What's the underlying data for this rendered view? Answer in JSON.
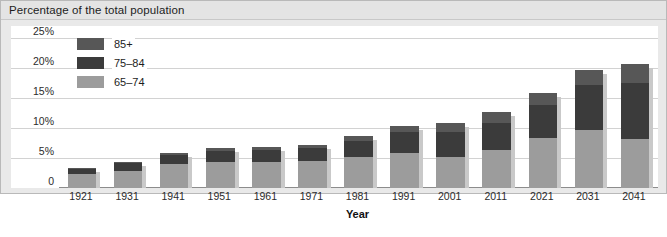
{
  "panel": {
    "title": "Percentage of the total population"
  },
  "axis": {
    "x_title": "Year",
    "y_tick_labels": [
      "0",
      "5%",
      "10%",
      "15%",
      "20%",
      "25%"
    ]
  },
  "legend": {
    "entries": [
      {
        "label": "85+",
        "color": "#575757"
      },
      {
        "label": "75–84",
        "color": "#3b3b3b"
      },
      {
        "label": "65–74",
        "color": "#9c9c9c"
      }
    ]
  },
  "chart_data": {
    "type": "bar",
    "stacked": true,
    "title": "Percentage of the total population",
    "xlabel": "Year",
    "ylabel": "",
    "ylim": [
      0,
      27
    ],
    "yticks": [
      0,
      5,
      10,
      15,
      20,
      25
    ],
    "ytick_labels": [
      "0",
      "5%",
      "10%",
      "15%",
      "20%",
      "25%"
    ],
    "grid": true,
    "legend_position": "upper-left-inside",
    "categories": [
      "1921",
      "1931",
      "1941",
      "1951",
      "1961",
      "1971",
      "1981",
      "1991",
      "2001",
      "2011",
      "2021",
      "2031",
      "2041"
    ],
    "series": [
      {
        "name": "65–74",
        "color": "#9c9c9c",
        "values": [
          2.3,
          2.9,
          4.0,
          4.4,
          4.3,
          4.5,
          5.1,
          5.9,
          5.1,
          6.4,
          8.3,
          9.6,
          8.1
        ]
      },
      {
        "name": "75–84",
        "color": "#3b3b3b",
        "values": [
          0.9,
          1.2,
          1.5,
          1.8,
          2.0,
          2.1,
          2.7,
          3.4,
          4.3,
          4.4,
          5.6,
          7.6,
          9.4
        ]
      },
      {
        "name": "85+",
        "color": "#575757",
        "values": [
          0.2,
          0.3,
          0.4,
          0.4,
          0.5,
          0.6,
          0.8,
          1.0,
          1.5,
          1.8,
          2.0,
          2.5,
          3.1
        ]
      }
    ],
    "totals": [
      3.4,
      4.4,
      5.9,
      6.6,
      6.8,
      7.2,
      8.6,
      10.3,
      10.9,
      12.6,
      15.9,
      19.7,
      20.6
    ]
  }
}
